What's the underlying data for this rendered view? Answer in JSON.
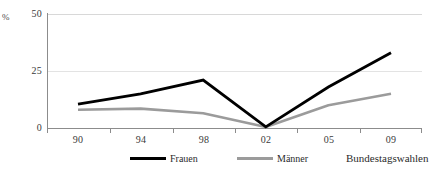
{
  "chart_data": {
    "type": "line",
    "title": "",
    "xlabel": "Bundestagswahlen",
    "ylabel": "%",
    "categories": [
      "90",
      "94",
      "98",
      "02",
      "05",
      "09"
    ],
    "ylim": [
      0,
      50
    ],
    "yticks": [
      "0",
      "25",
      "50"
    ],
    "grid": true,
    "legend_position": "bottom",
    "series": [
      {
        "name": "Frauen",
        "color": "#000000",
        "values": [
          10.5,
          15.0,
          21.0,
          0.5,
          18.0,
          33.0
        ]
      },
      {
        "name": "Männer",
        "color": "#9b9b9b",
        "values": [
          8.0,
          8.5,
          6.5,
          0.5,
          10.0,
          15.0
        ]
      }
    ]
  },
  "axes": {
    "y_unit": "%",
    "y_tick_50": "50",
    "y_tick_25": "25",
    "y_tick_0": "0",
    "x_tick_0": "90",
    "x_tick_1": "94",
    "x_tick_2": "98",
    "x_tick_3": "02",
    "x_tick_4": "05",
    "x_tick_5": "09",
    "x_axis_title": "Bundestagswahlen"
  },
  "legend": {
    "frauen_label": "Frauen",
    "maenner_label": "Männer"
  },
  "colors": {
    "frauen": "#000000",
    "maenner": "#9b9b9b",
    "axis": "#8c8c8c",
    "grid": "#e3e3e3",
    "background": "#ffffff"
  }
}
